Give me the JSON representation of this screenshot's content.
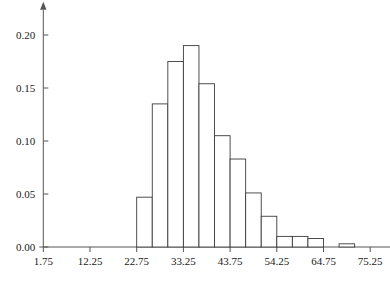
{
  "chart_data": {
    "type": "bar",
    "title": "",
    "subtitle": "",
    "xlabel": "",
    "ylabel": "",
    "grid": false,
    "legend": "none",
    "xlim": [
      1.75,
      78.75
    ],
    "ylim": [
      0.0,
      0.205
    ],
    "bin_width": 3.5,
    "x_tick_labels": [
      "1.75",
      "12.25",
      "22.75",
      "33.25",
      "43.75",
      "54.25",
      "64.75",
      "75.25"
    ],
    "x_tick_values": [
      1.75,
      12.25,
      22.75,
      33.25,
      43.75,
      54.25,
      64.75,
      75.25
    ],
    "y_tick_labels": [
      "0.00",
      "0.05",
      "0.10",
      "0.15",
      "0.20"
    ],
    "y_tick_values": [
      0.0,
      0.05,
      0.1,
      0.15,
      0.2
    ],
    "categories": [
      "22.75-26.25",
      "26.25-29.75",
      "29.75-33.25",
      "33.25-36.75",
      "36.75-40.25",
      "40.25-43.75",
      "43.75-47.25",
      "47.25-50.75",
      "50.75-54.25",
      "54.25-57.75",
      "57.75-61.25",
      "61.25-64.75",
      "68.25-71.75"
    ],
    "bin_starts": [
      22.75,
      26.25,
      29.75,
      33.25,
      36.75,
      40.25,
      43.75,
      47.25,
      50.75,
      54.25,
      57.75,
      61.25,
      68.25
    ],
    "values": [
      0.047,
      0.135,
      0.175,
      0.19,
      0.154,
      0.105,
      0.083,
      0.051,
      0.029,
      0.01,
      0.01,
      0.008,
      0.003
    ],
    "bar_fill": "#ffffff",
    "bar_stroke": "#3b3b3b",
    "axis_color": "#555555",
    "text_color": "#1a1a1a"
  },
  "axes": {
    "x_axis_name": "x-axis",
    "y_axis_name": "y-axis"
  }
}
